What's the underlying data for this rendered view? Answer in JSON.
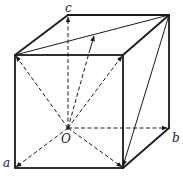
{
  "figure": {
    "type": "cube-vector-diagram",
    "labels": {
      "origin": "O",
      "a": "a",
      "b": "b",
      "c": "c"
    },
    "points": {
      "O": [
        68,
        128
      ],
      "A_front_bottom_left": [
        15,
        168
      ],
      "B_back_bottom_right": [
        169,
        128
      ],
      "C_back_top_left": [
        68,
        15
      ],
      "front_top_left": [
        15,
        55
      ],
      "front_top_right": [
        123,
        55
      ],
      "front_bottom_right": [
        123,
        168
      ],
      "back_top_right": [
        169,
        15
      ],
      "top_diagonal_point": [
        94,
        35
      ]
    },
    "dashed_vectors_from_O": [
      "a",
      "b",
      "c",
      "front_top_left",
      "front_top_right",
      "front_bottom_right",
      "top_diagonal_point"
    ],
    "solid_lines": [
      "top_face_diagonal",
      "back_top_right_to_front_bottom_right"
    ],
    "stroke_color": "#1a1a1a",
    "background": "#ffffff"
  }
}
